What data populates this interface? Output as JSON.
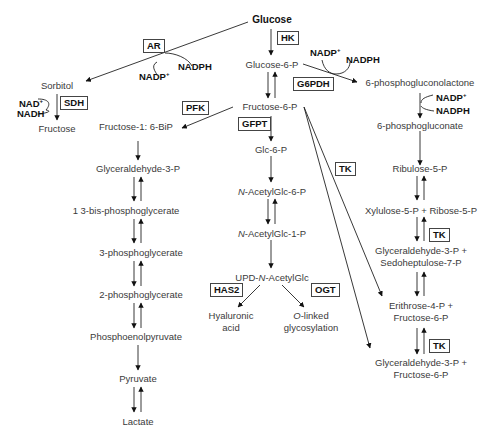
{
  "nodes": {
    "glucose": "Glucose",
    "glucose6p": "Glucose-6-P",
    "fructose6p": "Fructose-6-P",
    "sorbitol": "Sorbitol",
    "fructose": "Fructose",
    "fructose16bp": "Fructose-1: 6-BiP",
    "glyceraldehyde3p": "Glyceraldehyde-3-P",
    "bpg13": "1 3-bis-phosphoglycerate",
    "pg3": "3-phosphoglycerate",
    "pg2": "2-phosphoglycerate",
    "pep": "Phosphoenolpyruvate",
    "pyruvate": "Pyruvate",
    "lactate": "Lactate",
    "glc6p": "Glc-6-P",
    "acetylglc6p_prefix": "N",
    "acetylglc6p_rest": "-AcetylGlc-6-P",
    "acetylglc1p_prefix": "N",
    "acetylglc1p_rest": "-AcetylGlc-1-P",
    "udp_a": "UPD-",
    "udp_n": "N",
    "udp_b": "-AcetylGlc",
    "hyaluronic1": "Hyaluronic",
    "hyaluronic2": "acid",
    "olinked_o": "O",
    "olinked_rest": "-linked",
    "olinked2": "glycosylation",
    "pgl6": "6-phosphogluconolactone",
    "pg6": "6-phosphogluconate",
    "ribulose5p": "Ribulose-5-P",
    "xyl_rib": "Xylulose-5-P + Ribose-5-P",
    "gap_s7p_1": "Glyceraldehyde-3-P +",
    "gap_s7p_2": "Sedoheptulose-7-P",
    "e4p_f6p_1": "Erithrose-4-P +",
    "e4p_f6p_2": "Fructose-6-P",
    "gap_f6p_1": "Glyceraldehyde-3-P +",
    "gap_f6p_2": "Fructose-6-P"
  },
  "enzymes": {
    "ar": "AR",
    "hk": "HK",
    "sdh": "SDH",
    "pfk": "PFK",
    "gfpt": "GFPT",
    "g6pdh": "G6PDH",
    "tk1": "TK",
    "tk2": "TK",
    "tk3": "TK",
    "has2": "HAS2",
    "ogt": "OGT"
  },
  "cofactors": {
    "ar_nadp": "NADP",
    "ar_nadph": "NADPH",
    "sdh_nad": "NAD",
    "sdh_nadh": "NADH",
    "g6pdh_nadp": "NADP",
    "g6pdh_nadph": "NADPH",
    "pgd_nadp": "NADP",
    "pgd_nadph": "NADPH",
    "plus": "+"
  }
}
